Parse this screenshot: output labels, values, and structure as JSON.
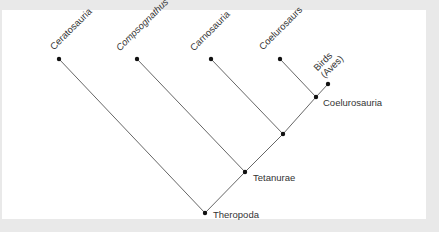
{
  "diagram": {
    "type": "cladogram",
    "colors": {
      "background": "#e9e9e9",
      "panel": "#ffffff",
      "branch": "#555555",
      "node": "#111111",
      "text": "#333333"
    },
    "tips": [
      {
        "id": "ceratosauria",
        "label": "Ceratosauria",
        "italic": false
      },
      {
        "id": "compsognathus",
        "label": "Compsognathus",
        "italic": true
      },
      {
        "id": "carnosauria",
        "label": "Carnosauria",
        "italic": false
      },
      {
        "id": "coelurosaurs",
        "label": "Coelurosaurs",
        "italic": false
      },
      {
        "id": "birds",
        "label": "Birds",
        "label2": "(Aves)",
        "italic": false
      }
    ],
    "internal_nodes": [
      {
        "id": "theropoda",
        "label": "Theropoda"
      },
      {
        "id": "tetanurae",
        "label": "Tetanurae"
      },
      {
        "id": "unnamed",
        "label": ""
      },
      {
        "id": "coelurosauria",
        "label": "Coelurosauria"
      }
    ],
    "edges": [
      [
        "theropoda",
        "ceratosauria"
      ],
      [
        "theropoda",
        "tetanurae"
      ],
      [
        "tetanurae",
        "compsognathus"
      ],
      [
        "tetanurae",
        "unnamed"
      ],
      [
        "unnamed",
        "carnosauria"
      ],
      [
        "unnamed",
        "coelurosauria"
      ],
      [
        "coelurosauria",
        "coelurosaurs"
      ],
      [
        "coelurosauria",
        "birds"
      ]
    ]
  }
}
